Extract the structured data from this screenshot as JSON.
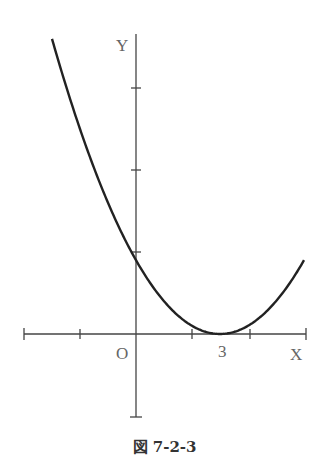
{
  "chart_data": {
    "type": "line",
    "title": "",
    "caption": "図 7-2-3",
    "xlabel": "X",
    "ylabel": "Y",
    "origin_label": "O",
    "function": "y = (x - 3)^2",
    "vertex": {
      "x": 3,
      "y": 0,
      "label": "3"
    },
    "y_intercept": 9,
    "x_range": [
      -3,
      6
    ],
    "xlim": [
      -4,
      6
    ],
    "ylim": [
      -10,
      36
    ],
    "x_ticks": [
      -4,
      -2,
      0,
      2,
      4,
      6
    ],
    "y_ticks": [
      10,
      20,
      30,
      -10
    ],
    "grid": false,
    "series": [
      {
        "name": "parabola",
        "x": [
          -3,
          -2,
          -1,
          0,
          1,
          2,
          3,
          4,
          5,
          6
        ],
        "values": [
          36,
          25,
          16,
          9,
          4,
          1,
          0,
          1,
          4,
          9
        ]
      }
    ]
  },
  "labels": {
    "y_axis": "Y",
    "x_axis": "X",
    "origin": "O",
    "vertex_x": "3",
    "caption": "図 7-2-3"
  }
}
